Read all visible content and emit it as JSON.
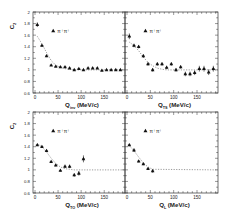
{
  "chart_data": [
    {
      "type": "scatter",
      "panel": "top-left",
      "title": "",
      "xlabel": "Q_inv (MeV/c)",
      "xlabel_main": "Q",
      "xlabel_sub": "inv",
      "xlabel_unit": "(MeV/c)",
      "ylabel": "C_2",
      "ylabel_main": "C",
      "ylabel_sub": "2",
      "xlim": [
        0,
        195
      ],
      "ylim": [
        0.6,
        2.0
      ],
      "xticks": [
        0,
        50,
        100,
        150
      ],
      "yticks": [
        0.6,
        0.8,
        1.0,
        1.2,
        1.4,
        1.6,
        1.8,
        2.0
      ],
      "ytick_labels": [
        "0.6",
        "0.8",
        "1",
        "1.2",
        "1.4",
        "1.6",
        "1.8",
        "2"
      ],
      "legend": "π⁺π⁺",
      "legend_marker": "triangle",
      "grid": false,
      "series": [
        {
          "name": "π⁺π⁺",
          "x": [
            5,
            15,
            25,
            35,
            45,
            55,
            65,
            75,
            85,
            95,
            105,
            115,
            125,
            135,
            145,
            155,
            165,
            175,
            185
          ],
          "y": [
            1.78,
            1.42,
            1.24,
            1.08,
            1.06,
            1.05,
            1.05,
            1.03,
            1.0,
            1.02,
            1.0,
            1.03,
            1.03,
            1.03,
            0.99,
            1.0,
            1.0,
            1.0,
            1.0
          ],
          "err": [
            0.04,
            0.02,
            0.02,
            0.01,
            0.01,
            0.01,
            0.01,
            0.01,
            0.01,
            0.01,
            0.01,
            0.01,
            0.01,
            0.01,
            0.01,
            0.01,
            0.01,
            0.01,
            0.01
          ]
        }
      ],
      "fit_curve": {
        "style": "dashed",
        "y": [
          1.58,
          1.45,
          1.3,
          1.16,
          1.08,
          1.04,
          1.02,
          1.01,
          1.0,
          1.0,
          1.0,
          1.0,
          1.0,
          1.0,
          1.0,
          1.0,
          1.0,
          1.0,
          1.0
        ]
      }
    },
    {
      "type": "scatter",
      "panel": "top-right",
      "title": "",
      "xlabel": "Q_TS (MeV/c)",
      "xlabel_main": "Q",
      "xlabel_sub": "TS",
      "xlabel_unit": "(MeV/c)",
      "ylabel": "",
      "xlim": [
        0,
        195
      ],
      "ylim": [
        0.6,
        2.0
      ],
      "xticks": [
        0,
        50,
        100,
        150
      ],
      "legend": "π⁺π⁺",
      "legend_marker": "triangle",
      "grid": false,
      "series": [
        {
          "name": "π⁺π⁺",
          "x": [
            5,
            15,
            25,
            35,
            45,
            55,
            65,
            75,
            85,
            95,
            105,
            115,
            125,
            135,
            145,
            155,
            165,
            175,
            185
          ],
          "y": [
            1.58,
            1.42,
            1.4,
            1.24,
            1.1,
            1.0,
            1.1,
            1.1,
            1.04,
            1.1,
            1.0,
            1.05,
            0.93,
            0.93,
            0.95,
            1.02,
            1.02,
            0.96,
            1.02
          ],
          "err": [
            0.05,
            0.03,
            0.03,
            0.03,
            0.03,
            0.03,
            0.03,
            0.03,
            0.03,
            0.03,
            0.03,
            0.03,
            0.04,
            0.04,
            0.04,
            0.05,
            0.05,
            0.05,
            0.05
          ]
        }
      ],
      "fit_curve": {
        "style": "dashed",
        "y": [
          1.48,
          1.42,
          1.33,
          1.22,
          1.13,
          1.07,
          1.03,
          1.01,
          1.0,
          1.0,
          1.0,
          1.0,
          1.0,
          1.0,
          1.0,
          1.0,
          1.0,
          1.0,
          1.0
        ]
      }
    },
    {
      "type": "scatter",
      "panel": "bottom-left",
      "title": "",
      "xlabel": "Q_TO (MeV/c)",
      "xlabel_main": "Q",
      "xlabel_sub": "TO",
      "xlabel_unit": "(MeV/c)",
      "ylabel": "C_2",
      "ylabel_main": "C",
      "ylabel_sub": "2",
      "xlim": [
        0,
        195
      ],
      "ylim": [
        0.6,
        2.0
      ],
      "xticks": [
        0,
        50,
        100,
        150
      ],
      "yticks": [
        0.6,
        0.8,
        1.0,
        1.2,
        1.4,
        1.6,
        1.8,
        2.0
      ],
      "ytick_labels": [
        "0.6",
        "0.8",
        "1",
        "1.2",
        "1.4",
        "1.6",
        "1.8",
        "2"
      ],
      "legend": "π⁺π⁺",
      "legend_marker": "triangle",
      "grid": false,
      "series": [
        {
          "name": "π⁺π⁺",
          "x": [
            5,
            15,
            25,
            35,
            45,
            55,
            65,
            75,
            85,
            95,
            105
          ],
          "y": [
            1.43,
            1.4,
            1.33,
            1.14,
            1.08,
            0.99,
            1.06,
            1.06,
            0.91,
            0.94,
            1.19
          ],
          "err": [
            0.02,
            0.02,
            0.02,
            0.02,
            0.02,
            0.02,
            0.03,
            0.03,
            0.03,
            0.04,
            0.06
          ]
        }
      ],
      "fit_curve": {
        "style": "dashed",
        "y": [
          1.45,
          1.4,
          1.31,
          1.2,
          1.11,
          1.05,
          1.02,
          1.01,
          1.0,
          1.0,
          1.0
        ]
      }
    },
    {
      "type": "scatter",
      "panel": "bottom-right",
      "title": "",
      "xlabel": "Q_L (MeV/c)",
      "xlabel_main": "Q",
      "xlabel_sub": "L",
      "xlabel_unit": "(MeV/c)",
      "ylabel": "",
      "xlim": [
        0,
        195
      ],
      "ylim": [
        0.6,
        2.0
      ],
      "xticks": [
        0,
        50,
        100,
        150
      ],
      "legend": "π⁺π⁺",
      "legend_marker": "triangle",
      "grid": false,
      "series": [
        {
          "name": "π⁺π⁺",
          "x": [
            5,
            15,
            25,
            35,
            45,
            55
          ],
          "y": [
            1.43,
            1.34,
            1.15,
            1.1,
            1.02,
            0.98
          ],
          "err": [
            0.02,
            0.03,
            0.02,
            0.02,
            0.02,
            0.03
          ]
        }
      ],
      "fit_curve": {
        "style": "dashed",
        "y": [
          1.42,
          1.33,
          1.22,
          1.12,
          1.05,
          1.01
        ]
      }
    }
  ],
  "axis_text": {
    "unit": "(MeV/c)",
    "q": "Q",
    "c": "C",
    "c_sub": "2",
    "legend_label": "π⁺π⁺",
    "xtick_labels": [
      "0",
      "50",
      "100",
      "150"
    ],
    "ytick_labels": [
      "0.6",
      "0.8",
      "1",
      "1.2",
      "1.4",
      "1.6",
      "1.8",
      "2"
    ]
  }
}
